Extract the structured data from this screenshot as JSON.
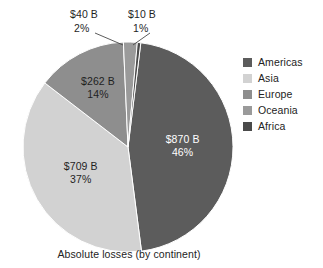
{
  "chart_data": {
    "type": "pie",
    "title": "",
    "caption": "Absolute losses (by continent)",
    "categories": [
      "Americas",
      "Asia",
      "Europe",
      "Oceania",
      "Africa"
    ],
    "values": [
      870,
      709,
      262,
      40,
      10
    ],
    "percentages": [
      46,
      37,
      14,
      2,
      1
    ],
    "unit": "B",
    "currency": "$",
    "value_labels": [
      "$870 B",
      "$709 B",
      "$262 B",
      "$40 B",
      "$10 B"
    ],
    "percent_labels": [
      "46%",
      "37%",
      "14%",
      "2%",
      "1%"
    ],
    "colors": [
      "#5c5c5c",
      "#d2d2d2",
      "#8e8e8e",
      "#9a9a9a",
      "#4a4a4a"
    ],
    "legend_position": "right",
    "grid": false,
    "start_angle_deg": 7,
    "direction": "clockwise",
    "slices": [
      {
        "name": "Americas",
        "value": 870,
        "percent": 46,
        "value_label": "$870 B",
        "percent_label": "46%",
        "color": "#5c5c5c",
        "label_placement": "inside",
        "label_color": "on-dark"
      },
      {
        "name": "Asia",
        "value": 709,
        "percent": 37,
        "value_label": "$709 B",
        "percent_label": "37%",
        "color": "#d2d2d2",
        "label_placement": "inside",
        "label_color": "on-light"
      },
      {
        "name": "Europe",
        "value": 262,
        "percent": 14,
        "value_label": "$262 B",
        "percent_label": "14%",
        "color": "#8e8e8e",
        "label_placement": "inside",
        "label_color": "on-light"
      },
      {
        "name": "Oceania",
        "value": 40,
        "percent": 2,
        "value_label": "$40 B",
        "percent_label": "2%",
        "color": "#9a9a9a",
        "label_placement": "callout",
        "label_color": "on-light"
      },
      {
        "name": "Africa",
        "value": 10,
        "percent": 1,
        "value_label": "$10 B",
        "percent_label": "1%",
        "color": "#4a4a4a",
        "label_placement": "callout",
        "label_color": "on-light"
      }
    ]
  },
  "legend": {
    "items": [
      {
        "label": "Americas",
        "color": "#5c5c5c"
      },
      {
        "label": "Asia",
        "color": "#d2d2d2"
      },
      {
        "label": "Europe",
        "color": "#8e8e8e"
      },
      {
        "label": "Oceania",
        "color": "#9a9a9a"
      },
      {
        "label": "Africa",
        "color": "#4a4a4a"
      }
    ]
  },
  "caption": {
    "text": "Absolute losses (by continent)"
  }
}
